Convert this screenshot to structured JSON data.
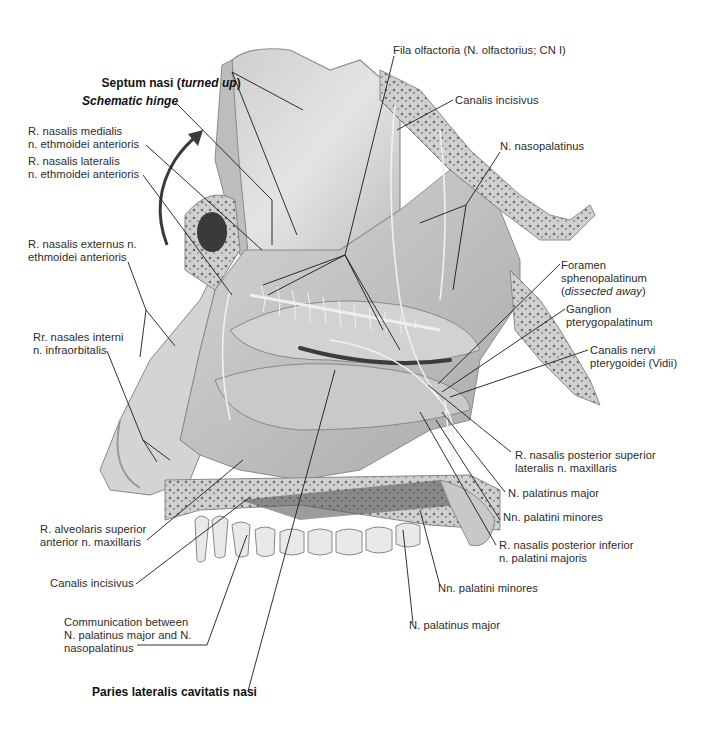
{
  "figure": {
    "colors": {
      "background": "#ffffff",
      "label_text": "#2b2b2b",
      "leader_line": "#1a1a1a",
      "hinge_arrow": "#3a3a3a",
      "tissue_light": "#d9d9d9",
      "tissue_mid": "#b8b8b8",
      "bone_dark": "#6e6e6e"
    }
  },
  "labels": {
    "septum_nasi": {
      "main": "Septum nasi (",
      "italic": "turned up",
      "close": ")"
    },
    "schematic_hinge": "Schematic hinge",
    "r_nasalis_medialis": "R. nasalis medialis\nn. ethmoidei anterioris",
    "r_nasalis_lateralis": "R. nasalis lateralis\nn. ethmoidei anterioris",
    "r_nasalis_externus": "R. nasalis externus n.\nethmoidei anterioris",
    "rr_nasales_interni": "Rr. nasales interni\nn. infraorbitalis",
    "r_alveolaris_superior": "R. alveolaris superior\nanterior n. maxillaris",
    "canalis_incisivus_bottom": "Canalis incisivus",
    "communication": "Communication between\nN. palatinus major and N.\nnasopalatinus",
    "paries_lateralis": "Paries lateralis cavitatis nasi",
    "fila_olfactoria": "Fila olfactoria (N. olfactorius; CN I)",
    "canalis_incisivus_top": "Canalis incisivus",
    "n_nasopalatinus": "N. nasopalatinus",
    "foramen_sphenopalatinum": {
      "main": "Foramen\nsphenopalatinum\n(",
      "italic": "dissected away",
      "close": ")"
    },
    "ganglion_pterygopalatinum": "Ganglion\npterygopalatinum",
    "canalis_nervi_pterygoidei": "Canalis nervi\npterygoidei (Vidii)",
    "r_nasalis_posterior_superior": "R. nasalis posterior superior\nlateralis n. maxillaris",
    "n_palatinus_major_right": "N. palatinus major",
    "nn_palatini_minores_right": "Nn. palatini minores",
    "r_nasalis_posterior_inferior": "R. nasalis posterior inferior\nn. palatini majoris",
    "nn_palatini_minores_bottom": "Nn. palatini minores",
    "n_palatinus_major_bottom": "N. palatinus major"
  }
}
